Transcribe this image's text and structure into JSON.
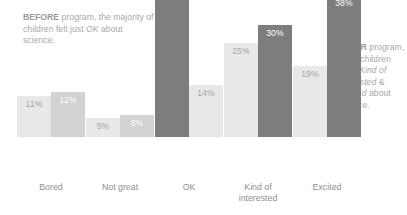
{
  "chart_data": {
    "type": "bar",
    "title": "",
    "subtitle": "",
    "xlabel": "",
    "ylabel": "",
    "ylim": [
      0,
      40
    ],
    "grid": false,
    "legend_position": "none",
    "value_suffix": "%",
    "categories": [
      "Bored",
      "Not great",
      "OK",
      "Kind of interested",
      "Excited"
    ],
    "series": [
      {
        "name": "BEFORE",
        "values": [
          11,
          5,
          40,
          25,
          19
        ]
      },
      {
        "name": "AFTER",
        "values": [
          12,
          6,
          14,
          30,
          38
        ]
      }
    ],
    "bars": [
      {
        "category": "Bored",
        "series": "BEFORE",
        "value": 11,
        "label": "11%",
        "tone": "light"
      },
      {
        "category": "Bored",
        "series": "AFTER",
        "value": 12,
        "label": "12%",
        "tone": "mid"
      },
      {
        "category": "Not great",
        "series": "BEFORE",
        "value": 5,
        "label": "5%",
        "tone": "light"
      },
      {
        "category": "Not great",
        "series": "AFTER",
        "value": 6,
        "label": "6%",
        "tone": "mid"
      },
      {
        "category": "OK",
        "series": "BEFORE",
        "value": 40,
        "label": "40%",
        "tone": "dark"
      },
      {
        "category": "OK",
        "series": "AFTER",
        "value": 14,
        "label": "14%",
        "tone": "light"
      },
      {
        "category": "Kind of interested",
        "series": "BEFORE",
        "value": 25,
        "label": "25%",
        "tone": "light"
      },
      {
        "category": "Kind of interested",
        "series": "AFTER",
        "value": 30,
        "label": "30%",
        "tone": "dark"
      },
      {
        "category": "Excited",
        "series": "BEFORE",
        "value": 19,
        "label": "19%",
        "tone": "light"
      },
      {
        "category": "Excited",
        "series": "AFTER",
        "value": 38,
        "label": "38%",
        "tone": "dark"
      }
    ],
    "colors": {
      "light": "#e8e8e8",
      "mid": "#d2d2d2",
      "dark": "#7d7d7d",
      "text": "#a8a8a8",
      "label": "#8f8f8f",
      "background": "#ffffff"
    },
    "annotations": [
      {
        "id": "before",
        "lead": "BEFORE",
        "text_1": " program, the majority of children felt just ",
        "emphasis": "OK",
        "text_2": " about science."
      },
      {
        "id": "after",
        "lead": "AFTER",
        "text_1": " program, more children were ",
        "emphasis_1": "Kind of interested",
        "text_2": " & ",
        "emphasis_2": "Excited",
        "text_3": " about science."
      }
    ]
  },
  "category_labels": {
    "bored": "Bored",
    "not_great": "Not great",
    "ok": "OK",
    "kind_of_interested_line1": "Kind of",
    "kind_of_interested_line2": "interested",
    "excited": "Excited"
  }
}
